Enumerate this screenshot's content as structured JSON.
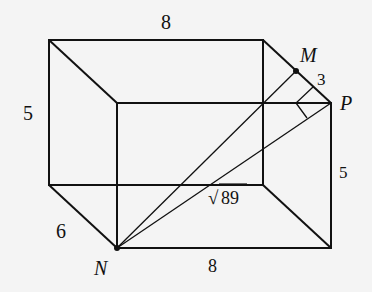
{
  "diagram": {
    "type": "rectangular prism",
    "colors": {
      "line": "#111111",
      "background": "#f4f4f4"
    },
    "vertices": {
      "N": {
        "label": "N"
      },
      "M": {
        "label": "M"
      },
      "P": {
        "label": "P"
      }
    },
    "edge_labels": {
      "top": "8",
      "left": "5",
      "right": "5",
      "depth": "6",
      "bottom": "8",
      "mp": "3",
      "diagonal": "89",
      "diagonal_radical": "√"
    }
  }
}
